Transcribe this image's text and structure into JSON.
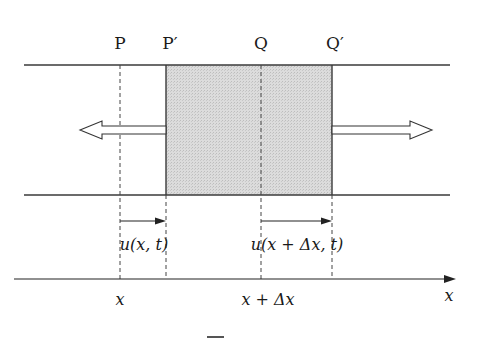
{
  "diagram": {
    "point_labels": {
      "P": "P",
      "P_prime": "P′",
      "Q": "Q",
      "Q_prime": "Q′"
    },
    "displacement_labels": {
      "u_left": "u(x, t)",
      "u_right": "u(x + Δx, t)"
    },
    "axis_labels": {
      "x_tick": "x",
      "x_dx_tick": "x + Δx",
      "axis_name": "x"
    },
    "colors": {
      "line": "#3a3a3a",
      "shaded_block": "#d9d9d9",
      "arrow_fill": "#ffffff"
    }
  }
}
